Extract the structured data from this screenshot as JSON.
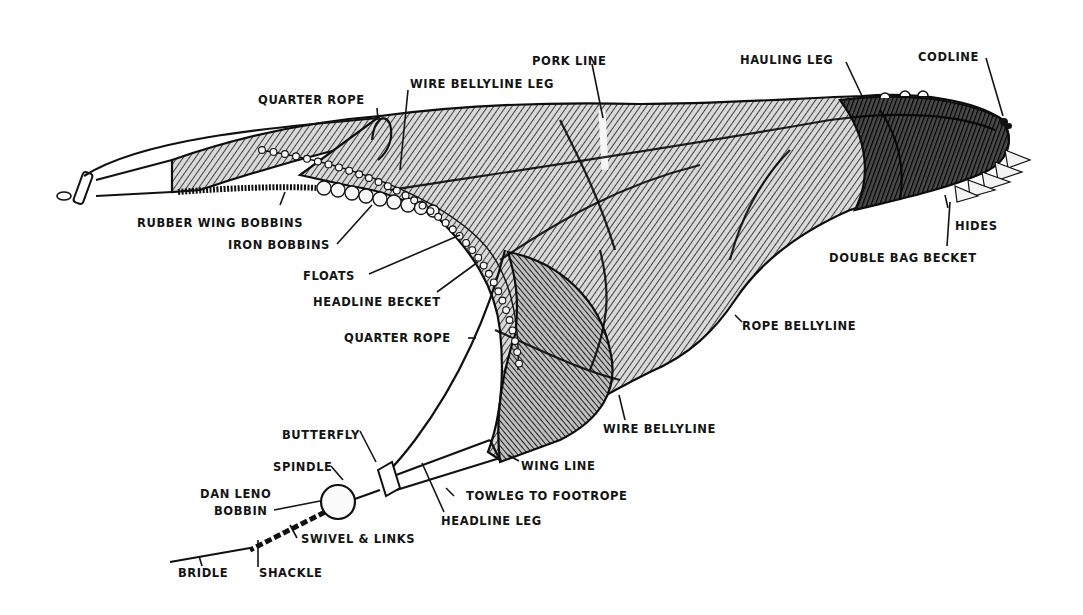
{
  "diagram": {
    "background_color": "#ffffff",
    "ink_color": "#141414",
    "labels": {
      "pork_line": "PORK LINE",
      "hauling_leg": "HAULING LEG",
      "codline": "CODLINE",
      "quarter_rope_top": "QUARTER ROPE",
      "wire_bellyline_leg": "WIRE BELLYLINE LEG",
      "rubber_wing_bobbins": "RUBBER WING BOBBINS",
      "iron_bobbins": "IRON BOBBINS",
      "hides": "HIDES",
      "floats": "FLOATS",
      "double_bag_becket": "DOUBLE BAG BECKET",
      "headline_becket": "HEADLINE BECKET",
      "quarter_rope_lower": "QUARTER ROPE",
      "rope_bellyline": "ROPE BELLYLINE",
      "wire_bellyline": "WIRE BELLYLINE",
      "butterfly": "BUTTERFLY",
      "wing_line": "WING LINE",
      "spindle": "SPINDLE",
      "dan_leno_line1": "DAN LENO",
      "dan_leno_line2": "BOBBIN",
      "towleg_to_footrope": "TOWLEG TO FOOTROPE",
      "headline_leg": "HEADLINE LEG",
      "swivel_links": "SWIVEL & LINKS",
      "bridle": "BRIDLE",
      "shackle": "SHACKLE"
    }
  }
}
